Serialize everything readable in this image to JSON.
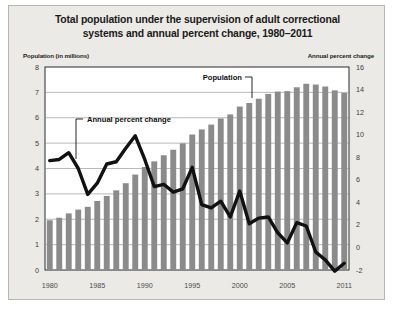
{
  "figure": {
    "title": "Total population under the supervision of adult correctional systems and annual percent change, 1980–2011",
    "title_line1": "Total population under the supervision of adult correctional",
    "title_line2": "systems and annual percent change, 1980–2011",
    "left_axis_label": "Population (in millions)",
    "right_axis_label": "Annual percent change",
    "background_color": "#eceae6",
    "plot_background_color": "#ffffff",
    "bar_color": "#8b8b8b",
    "line_color": "#111111"
  },
  "annotations": [
    {
      "name": "population-annotation",
      "text": "Population"
    },
    {
      "name": "annual-percent-change-annotation",
      "text": "Annual percent change"
    }
  ],
  "chart_data": {
    "type": "bar",
    "title": "Total population under the supervision of adult correctional systems and annual percent change, 1980–2011",
    "xlabel": "",
    "ylabel": "Population (in millions)",
    "y2label": "Annual percent change",
    "ylim": [
      0,
      8
    ],
    "y2lim": [
      -2,
      16
    ],
    "grid": true,
    "legend": "inline-annotations",
    "ytick_labels": [
      "0",
      "1",
      "2",
      "3",
      "4",
      "5",
      "6",
      "7",
      "8"
    ],
    "ytick_values": [
      0,
      1,
      2,
      3,
      4,
      5,
      6,
      7,
      8
    ],
    "y2tick_labels": [
      "-2",
      "0",
      "2",
      "4",
      "6",
      "8",
      "10",
      "12",
      "14",
      "16"
    ],
    "y2tick_values": [
      -2,
      0,
      2,
      4,
      6,
      8,
      10,
      12,
      14,
      16
    ],
    "xtick_labels": [
      "1980",
      "1985",
      "1990",
      "1995",
      "2000",
      "2005",
      "2011"
    ],
    "xtick_values": [
      1980,
      1985,
      1990,
      1995,
      2000,
      2005,
      2011
    ],
    "categories": [
      1980,
      1981,
      1982,
      1983,
      1984,
      1985,
      1986,
      1987,
      1988,
      1989,
      1990,
      1991,
      1992,
      1993,
      1994,
      1995,
      1996,
      1997,
      1998,
      1999,
      2000,
      2001,
      2002,
      2003,
      2004,
      2005,
      2006,
      2007,
      2008,
      2009,
      2010,
      2011
    ],
    "series": [
      {
        "name": "Population",
        "type": "bar",
        "axis": "left",
        "unit": "millions",
        "color": "#8b8b8b",
        "values": [
          1.96,
          2.06,
          2.23,
          2.38,
          2.49,
          2.72,
          2.92,
          3.14,
          3.42,
          3.76,
          4.06,
          4.28,
          4.52,
          4.74,
          4.99,
          5.34,
          5.54,
          5.73,
          5.97,
          6.13,
          6.44,
          6.58,
          6.75,
          6.94,
          7.03,
          7.05,
          7.2,
          7.34,
          7.31,
          7.23,
          7.08,
          6.98
        ]
      },
      {
        "name": "Annual percent change",
        "type": "line",
        "axis": "right",
        "unit": "percent",
        "color": "#111111",
        "values": [
          7.7,
          7.8,
          8.4,
          7.0,
          4.7,
          5.7,
          7.4,
          7.6,
          8.8,
          9.9,
          7.8,
          5.4,
          5.6,
          4.9,
          5.2,
          7.1,
          3.8,
          3.5,
          4.1,
          2.7,
          5.0,
          2.1,
          2.6,
          2.7,
          1.3,
          0.4,
          2.2,
          1.9,
          -0.4,
          -1.1,
          -2.1,
          -1.4
        ]
      }
    ]
  }
}
